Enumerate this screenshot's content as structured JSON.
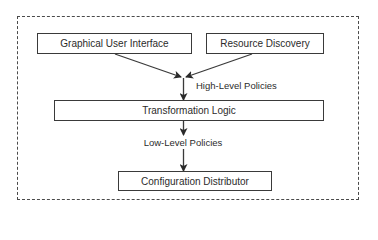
{
  "diagram": {
    "type": "flowchart",
    "container": {
      "style": "dashed"
    },
    "nodes": [
      {
        "id": "gui",
        "label": "Graphical User Interface"
      },
      {
        "id": "resource_discovery",
        "label": "Resource Discovery"
      },
      {
        "id": "transformation_logic",
        "label": "Transformation Logic"
      },
      {
        "id": "configuration_distributor",
        "label": "Configuration Distributor"
      }
    ],
    "edges": [
      {
        "from": "gui",
        "to": "transformation_logic",
        "label": "High-Level Policies"
      },
      {
        "from": "resource_discovery",
        "to": "transformation_logic",
        "label": "High-Level Policies"
      },
      {
        "from": "transformation_logic",
        "to": "configuration_distributor",
        "label": "Low-Level Policies"
      }
    ],
    "edge_labels": {
      "high": "High-Level Policies",
      "low": "Low-Level Policies"
    },
    "colors": {
      "stroke": "#3a3a3a",
      "text": "#2b2b2b",
      "background": "#ffffff"
    }
  }
}
